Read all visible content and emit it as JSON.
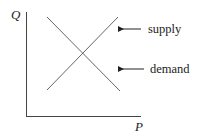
{
  "diagram": {
    "type": "supply-demand",
    "axes": {
      "y_label": "Q",
      "x_label": "P"
    },
    "curves": [
      {
        "name": "supply",
        "label": "supply",
        "direction": "upward-sloping"
      },
      {
        "name": "demand",
        "label": "demand",
        "direction": "downward-sloping"
      }
    ],
    "colors": {
      "line": "#444444",
      "text": "#222222",
      "background": "#ffffff"
    }
  }
}
